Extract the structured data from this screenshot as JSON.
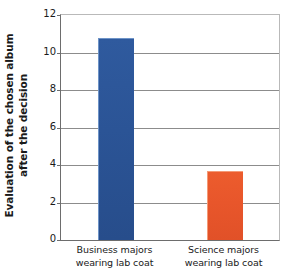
{
  "chart_data": {
    "type": "bar",
    "title": "",
    "xlabel": "",
    "ylabel_line1": "Evaluation of the chosen album",
    "ylabel_line2": "after the decision",
    "categories": [
      {
        "line1": "Business majors",
        "line2": "wearing lab coat"
      },
      {
        "line1": "Science majors",
        "line2": "wearing lab coat"
      }
    ],
    "values": [
      10.8,
      3.7
    ],
    "colors": [
      "#2b5496",
      "#e8562b"
    ],
    "ylim": [
      0,
      12
    ],
    "ytick_labels": [
      "0",
      "2",
      "4",
      "6",
      "8",
      "10",
      "12"
    ],
    "ytick_values": [
      0,
      2,
      4,
      6,
      8,
      10,
      12
    ],
    "grid": "horizontal",
    "legend": "none"
  }
}
